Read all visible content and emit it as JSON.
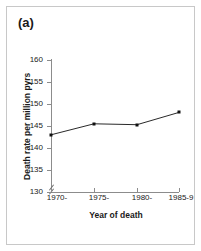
{
  "figure": {
    "panel_label": "(a)",
    "background_color": "#ffffff",
    "frame_color": "#c8c8c8",
    "axis_color": "#8c8c8c",
    "series_color": "#111111"
  },
  "chart_data": {
    "type": "line",
    "title": "(a)",
    "xlabel": "Year of death",
    "ylabel": "Death rate per million pyrs",
    "categories": [
      "1970-",
      "1975-",
      "1980-",
      "1985-9"
    ],
    "values": [
      143.0,
      145.5,
      145.3,
      148.1
    ],
    "series": [
      {
        "name": "Death rate",
        "values": [
          143.0,
          145.5,
          145.3,
          148.1
        ]
      }
    ],
    "ylim": [
      130,
      160
    ],
    "yticks": [
      130,
      135,
      140,
      145,
      150,
      155,
      160
    ],
    "ytick_labels": [
      "130",
      "135",
      "140",
      "145",
      "150",
      "155",
      "160"
    ],
    "grid": false,
    "legend": "none",
    "axis_break": true,
    "markers": "filled-square"
  }
}
